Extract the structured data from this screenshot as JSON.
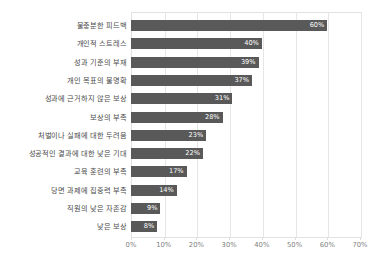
{
  "chart_data": {
    "type": "bar",
    "orientation": "horizontal",
    "title": "",
    "subtitle": "",
    "xlabel": "",
    "ylabel": "",
    "xlim": [
      0,
      70
    ],
    "grid": true,
    "legend": false,
    "legend_position": "none",
    "value_suffix": "%",
    "bar_color": "#595959",
    "label_color": "#4a4a4a",
    "value_label_color": "#ffffff",
    "gridline_color": "#e6e6e6",
    "xticks": [
      "0%",
      "10%",
      "20%",
      "30%",
      "40%",
      "50%",
      "60%",
      "70%"
    ],
    "xtick_values": [
      0,
      10,
      20,
      30,
      40,
      50,
      60,
      70
    ],
    "categories": [
      "불충분한 피드백",
      "개인적 스트레스",
      "성과 기준의 부재",
      "개인 목표의 불명확",
      "성과에 근거하지 않은 보상",
      "보상의 부족",
      "처벌이나 실패에 대한 두려움",
      "성공적인 결과에 대한 낮은 기대",
      "교육 훈련의 부족",
      "당면 과제에 집중력 부족",
      "직원의 낮은 자존감",
      "낮은 보상"
    ],
    "values": [
      60,
      40,
      39,
      37,
      31,
      28,
      23,
      22,
      17,
      14,
      9,
      8
    ],
    "value_labels": [
      "60%",
      "40%",
      "39%",
      "37%",
      "31%",
      "28%",
      "23%",
      "22%",
      "17%",
      "14%",
      "9%",
      "8%"
    ]
  }
}
